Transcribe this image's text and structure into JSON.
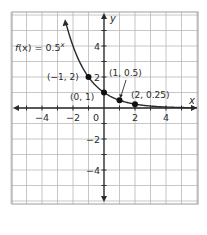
{
  "chart_data": {
    "type": "line",
    "title": "",
    "function_label": "f(x) = 0.5",
    "function_exponent": "x",
    "xlabel": "x",
    "ylabel": "y",
    "xlim": [
      -6,
      6
    ],
    "ylim": [
      -6,
      6
    ],
    "grid": true,
    "x_ticks": [
      -4,
      -2,
      0,
      2,
      4
    ],
    "y_ticks": [
      4,
      2,
      -2,
      -4
    ],
    "x_tick_labels": [
      "−4",
      "−2",
      "0",
      "2",
      "4"
    ],
    "y_tick_labels": [
      "4",
      "2",
      "−2",
      "−4"
    ],
    "origin_label": "0",
    "series": [
      {
        "name": "f(x) = 0.5^x",
        "x": [
          -2.4,
          -2,
          -1.5,
          -1,
          -0.5,
          0,
          0.5,
          1,
          1.5,
          2,
          3,
          4,
          5,
          6
        ],
        "values": [
          5.28,
          4,
          2.83,
          2,
          1.41,
          1,
          0.71,
          0.5,
          0.35,
          0.25,
          0.125,
          0.0625,
          0.031,
          0.016
        ]
      }
    ],
    "points": [
      {
        "x": -1,
        "y": 2,
        "label": "(−1, 2)"
      },
      {
        "x": 0,
        "y": 1,
        "label": "(0, 1)"
      },
      {
        "x": 1,
        "y": 0.5,
        "label": "(1, 0.5)"
      },
      {
        "x": 2,
        "y": 0.25,
        "label": "(2, 0.25)"
      }
    ],
    "colors": {
      "grid": "#b8b8b8",
      "frame": "#9a9a9a",
      "axis": "#2a2a2a",
      "curve": "#2a2a2a",
      "point": "#111111"
    }
  }
}
